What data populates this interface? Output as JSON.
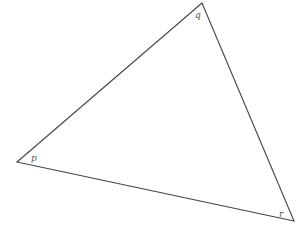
{
  "diagram": {
    "type": "triangle",
    "stroke_color": "#444444",
    "background": "#ffffff",
    "vertices": [
      {
        "name": "q",
        "label": "q",
        "x": 202,
        "y": 3,
        "label_x": 195,
        "label_y": 18
      },
      {
        "name": "p",
        "label": "p",
        "x": 17,
        "y": 162,
        "label_x": 31,
        "label_y": 161
      },
      {
        "name": "r",
        "label": "r",
        "x": 294,
        "y": 221,
        "label_x": 279,
        "label_y": 217
      }
    ],
    "edges": [
      {
        "from": "p",
        "to": "q"
      },
      {
        "from": "q",
        "to": "r"
      },
      {
        "from": "r",
        "to": "p"
      }
    ]
  }
}
